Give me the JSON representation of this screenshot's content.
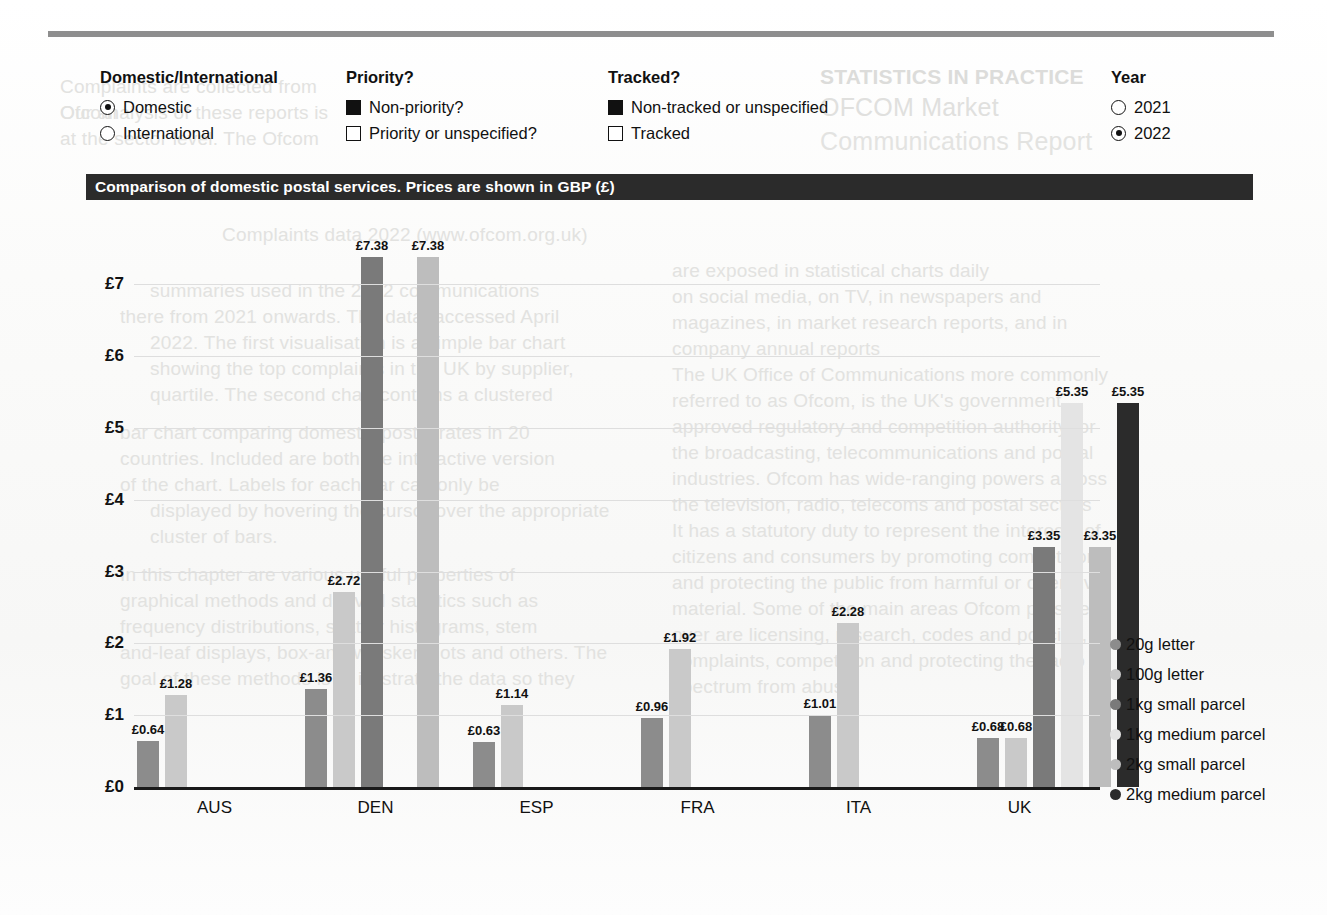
{
  "controls": {
    "groups": [
      {
        "name": "domestic-international",
        "title": "Domestic/International",
        "type": "radio",
        "options": [
          {
            "label": "Domestic",
            "selected": true
          },
          {
            "label": "International",
            "selected": false
          }
        ]
      },
      {
        "name": "priority",
        "title": "Priority?",
        "type": "checkbox",
        "options": [
          {
            "label": "Non-priority?",
            "selected": true
          },
          {
            "label": "Priority or unspecified?",
            "selected": false
          }
        ]
      },
      {
        "name": "tracked",
        "title": "Tracked?",
        "type": "checkbox",
        "options": [
          {
            "label": "Non-tracked or unspecified",
            "selected": true
          },
          {
            "label": "Tracked",
            "selected": false
          }
        ]
      },
      {
        "name": "year",
        "title": "Year",
        "type": "radio",
        "options": [
          {
            "label": "2021",
            "selected": false
          },
          {
            "label": "2022",
            "selected": true
          }
        ]
      }
    ]
  },
  "chart_data": {
    "type": "bar",
    "title": "Comparison of domestic postal services. Prices are shown in GBP (£)",
    "xlabel": "",
    "ylabel": "",
    "ylim": [
      0,
      7.8
    ],
    "grid": true,
    "legend_position": "right",
    "currency_symbol": "£",
    "yticks": [
      "£0",
      "£1",
      "£2",
      "£3",
      "£4",
      "£5",
      "£6",
      "£7"
    ],
    "ytick_values": [
      0,
      1,
      2,
      3,
      4,
      5,
      6,
      7
    ],
    "categories": [
      "AUS",
      "DEN",
      "ESP",
      "FRA",
      "ITA",
      "UK"
    ],
    "series": [
      {
        "name": "20g letter",
        "color": "#8c8c8c",
        "values": [
          0.64,
          1.36,
          0.63,
          0.96,
          1.01,
          0.68
        ]
      },
      {
        "name": "100g letter",
        "color": "#c9c9c9",
        "values": [
          1.28,
          2.72,
          1.14,
          1.92,
          2.28,
          0.68
        ]
      },
      {
        "name": "1kg small parcel",
        "color": "#7a7a7a",
        "values": [
          null,
          7.38,
          null,
          null,
          null,
          3.35
        ]
      },
      {
        "name": "1kg medium parcel",
        "color": "#e4e4e4",
        "values": [
          null,
          null,
          null,
          null,
          null,
          5.35
        ]
      },
      {
        "name": "2kg small parcel",
        "color": "#bdbdbd",
        "values": [
          null,
          7.38,
          null,
          null,
          null,
          3.35
        ]
      },
      {
        "name": "2kg medium parcel",
        "color": "#2b2b2b",
        "values": [
          null,
          null,
          null,
          null,
          null,
          5.35
        ]
      }
    ],
    "labels": {
      "AUS": [
        "£0.64",
        "£1.28"
      ],
      "DEN": [
        "£1.36",
        "£2.72",
        "£7.38",
        "£7.38"
      ],
      "ESP": [
        "£0.63",
        "£1.14"
      ],
      "FRA": [
        "£0.96",
        "£1.92"
      ],
      "ITA": [
        "£1.01",
        "£2.28"
      ],
      "UK": [
        "£0.68",
        "£0.68",
        "£3.35",
        "£5.35",
        "£3.35",
        "£5.35"
      ]
    }
  },
  "ghost": {
    "g1": "Complaints are collected from Ofcom",
    "g2": "Our analysis of these reports is",
    "g3": "at the sector level. The Ofcom",
    "g4": "Complaints data 2022 (www.ofcom.org.uk)",
    "g5": "summaries used in the 2022 communications",
    "g6": "there from 2021 onwards. The data, accessed April",
    "g7": "2022. The first visualisation is a simple bar chart",
    "g8": "showing the top complaints in the UK by supplier,",
    "g9": "quartile. The second chart contains a clustered",
    "g10": "bar chart comparing domestic postal rates in 20",
    "g11": "countries. Included are both the interactive version",
    "g12": "of the chart. Labels for each bar can only be",
    "g13": "displayed by hovering the cursor over the appropriate",
    "g14": "cluster of bars.",
    "g15": "In this chapter are various useful properties of",
    "g16": "graphical methods and derived statistics such as",
    "g17": "frequency distributions, scatter histograms, stem",
    "g18": "and-leaf displays, box-and-whisker plots and others. The",
    "g19": "goal of these methods is to illustrate the data so they",
    "g20": "are exposed in statistical charts daily",
    "g21": "on social media, on TV, in newspapers and",
    "g22": "magazines, in market research reports, and in",
    "g23": "company annual reports",
    "g24": "The UK Office of Communications more commonly",
    "g25": "referred to as Ofcom, is the UK's government",
    "g26": "approved regulatory and competition authority for",
    "g27": "the broadcasting, telecommunications and postal",
    "g28": "industries. Ofcom has wide-ranging powers across",
    "g29": "the television, radio, telecoms and postal sectors",
    "g30": "It has a statutory duty to represent the interests of",
    "g31": "citizens and consumers by promoting competition",
    "g32": "and protecting the public from harmful or offensive",
    "g33": "material. Some of the main areas Ofcom presides",
    "g34": "over are licensing, research, codes and policies,",
    "g35": "complaints, competition and protecting the radio",
    "g36": "spectrum from abuse",
    "g37": "STATISTICS IN PRACTICE",
    "g38": "OFCOM Market",
    "g39": "Communications Report"
  }
}
